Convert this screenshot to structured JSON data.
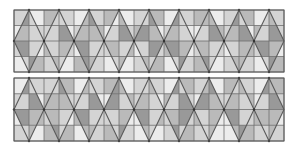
{
  "palette": {
    "0": "#ececec",
    "1": "#d4d4d4",
    "2": "#bababa",
    "3": "#999999"
  },
  "line_color": "#5a5a5a",
  "grid_color": "#6e6e6e",
  "panels": [
    {
      "name": "top-pattern-panel",
      "periods": 9,
      "outside": [
        [
          1,
          0,
          2,
          1,
          0,
          1,
          2,
          0,
          1,
          2,
          0,
          1,
          2,
          0,
          1,
          2,
          0,
          1
        ],
        [
          0,
          1,
          1,
          0,
          1,
          2,
          0,
          1,
          2,
          0,
          1,
          0,
          0,
          2,
          1,
          0,
          2,
          1
        ],
        [
          1,
          0,
          2,
          1,
          0,
          1,
          1,
          2,
          0,
          1,
          2,
          0,
          1,
          1,
          0,
          2,
          1,
          0
        ],
        [
          0,
          2,
          1,
          0,
          2,
          1,
          0,
          0,
          1,
          2,
          0,
          1,
          2,
          0,
          1,
          1,
          0,
          2
        ]
      ],
      "inside": [
        [
          [
            3,
            1
          ],
          [
            1,
            1
          ],
          [
            2,
            3
          ],
          [
            0,
            2
          ],
          [
            1,
            3
          ],
          [
            3,
            1
          ],
          [
            2,
            2
          ],
          [
            3,
            1
          ],
          [
            1,
            2
          ]
        ],
        [
          [
            2,
            1
          ],
          [
            1,
            3
          ],
          [
            2,
            2
          ],
          [
            1,
            3
          ],
          [
            3,
            2
          ],
          [
            2,
            1
          ],
          [
            1,
            3
          ],
          [
            2,
            3
          ],
          [
            1,
            3
          ]
        ],
        [
          [
            3,
            1
          ],
          [
            1,
            2
          ],
          [
            3,
            1
          ],
          [
            2,
            1
          ],
          [
            1,
            3
          ],
          [
            3,
            2
          ],
          [
            2,
            1
          ],
          [
            1,
            2
          ],
          [
            3,
            2
          ]
        ],
        [
          [
            1,
            3
          ],
          [
            2,
            1
          ],
          [
            3,
            2
          ],
          [
            1,
            2
          ],
          [
            2,
            1
          ],
          [
            1,
            3
          ],
          [
            3,
            1
          ],
          [
            2,
            2
          ],
          [
            1,
            3
          ]
        ]
      ]
    },
    {
      "name": "bottom-pattern-panel",
      "periods": 9,
      "outside": [
        [
          0,
          1,
          1,
          2,
          0,
          1,
          2,
          0,
          1,
          1,
          0,
          2,
          1,
          0,
          2,
          1,
          0,
          2
        ],
        [
          1,
          0,
          2,
          1,
          1,
          0,
          0,
          2,
          1,
          0,
          2,
          1,
          0,
          1,
          1,
          2,
          0,
          1
        ],
        [
          0,
          2,
          1,
          0,
          2,
          1,
          1,
          0,
          0,
          2,
          1,
          1,
          2,
          0,
          0,
          1,
          2,
          0
        ],
        [
          1,
          0,
          2,
          2,
          0,
          1,
          2,
          1,
          0,
          0,
          1,
          2,
          1,
          0,
          0,
          2,
          1,
          1
        ]
      ],
      "inside": [
        [
          [
            3,
            1
          ],
          [
            1,
            3
          ],
          [
            2,
            1
          ],
          [
            3,
            2
          ],
          [
            1,
            2
          ],
          [
            3,
            1
          ],
          [
            2,
            3
          ],
          [
            1,
            2
          ],
          [
            3,
            2
          ]
        ],
        [
          [
            1,
            3
          ],
          [
            2,
            2
          ],
          [
            1,
            3
          ],
          [
            3,
            1
          ],
          [
            2,
            1
          ],
          [
            1,
            3
          ],
          [
            3,
            2
          ],
          [
            2,
            1
          ],
          [
            1,
            3
          ]
        ],
        [
          [
            3,
            2
          ],
          [
            2,
            1
          ],
          [
            3,
            1
          ],
          [
            1,
            2
          ],
          [
            3,
            1
          ],
          [
            2,
            3
          ],
          [
            1,
            2
          ],
          [
            3,
            1
          ],
          [
            2,
            2
          ]
        ],
        [
          [
            1,
            2
          ],
          [
            3,
            1
          ],
          [
            2,
            2
          ],
          [
            1,
            3
          ],
          [
            2,
            1
          ],
          [
            3,
            1
          ],
          [
            1,
            2
          ],
          [
            2,
            3
          ],
          [
            1,
            2
          ]
        ]
      ]
    }
  ]
}
